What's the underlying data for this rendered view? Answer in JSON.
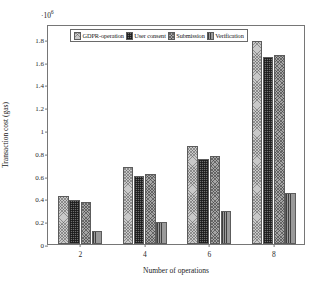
{
  "chart_data": {
    "type": "bar",
    "title": "",
    "subtitle": "",
    "xlabel": "Number of operations",
    "ylabel": "Transaction cost (gas)",
    "y_exponent_label": "·10",
    "y_exponent_power": "6",
    "y_scale_factor": 1000000,
    "categories": [
      "2",
      "4",
      "6",
      "8"
    ],
    "xticks": [
      "2",
      "4",
      "6",
      "8"
    ],
    "yticks": [
      "0",
      "0.2",
      "0.4",
      "0.6",
      "0.8",
      "1",
      "1.2",
      "1.4",
      "1.6",
      "1.8"
    ],
    "ytick_values": [
      0,
      0.2,
      0.4,
      0.6,
      0.8,
      1,
      1.2,
      1.4,
      1.6,
      1.8
    ],
    "ylim": [
      0,
      1.93
    ],
    "grid": false,
    "legend_position": "top-center-inside",
    "series": [
      {
        "name": "GDPR-operation",
        "pattern": "crosshatch-light",
        "color": "#c9c9c9",
        "values": [
          0.42,
          0.68,
          0.86,
          1.78
        ]
      },
      {
        "name": "User consent",
        "pattern": "grid-dark",
        "color": "#6e6e6e",
        "values": [
          0.39,
          0.6,
          0.75,
          1.64
        ]
      },
      {
        "name": "Submission",
        "pattern": "crosshatch-medium",
        "color": "#a6a6a6",
        "values": [
          0.37,
          0.61,
          0.77,
          1.66
        ]
      },
      {
        "name": "Verification",
        "pattern": "vertical-lines",
        "color": "#9a9a9a",
        "values": [
          0.11,
          0.19,
          0.29,
          0.45
        ]
      }
    ]
  },
  "legend": {
    "entries": [
      {
        "label": "GDPR-operation"
      },
      {
        "label": "User consent"
      },
      {
        "label": "Submission"
      },
      {
        "label": "Verification"
      }
    ]
  }
}
